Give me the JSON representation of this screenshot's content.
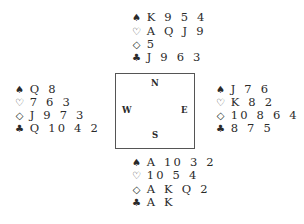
{
  "hands": {
    "north": {
      "spades": "K 9 5 4",
      "hearts": "A Q J 9",
      "diamonds": "5",
      "clubs": "J 9 6 3"
    },
    "west": {
      "spades": "Q 8",
      "hearts": "7 6 3",
      "diamonds": "J 9 7 3",
      "clubs": "Q 10 4 2"
    },
    "east": {
      "spades": "J 7 6",
      "hearts": "K 8 2",
      "diamonds": "10 8 6 4",
      "clubs": "8 7 5"
    },
    "south": {
      "spades": "A 10 3 2",
      "hearts": "10 5 4",
      "diamonds": "A K Q 2",
      "clubs": "A K"
    }
  },
  "suit_icons": {
    "spades": "♠",
    "hearts": "♡",
    "diamonds": "◇",
    "clubs": "♣"
  },
  "compass": {
    "north": "N",
    "west": "W",
    "east": "E",
    "south": "S"
  }
}
